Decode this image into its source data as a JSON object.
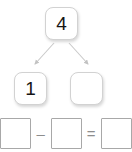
{
  "page": {
    "background_color": "#ffffff"
  },
  "number_bond": {
    "whole": {
      "label": "whole",
      "value": "4",
      "filled": true
    },
    "parts": [
      {
        "label": "part-left",
        "value": "1",
        "filled": true
      },
      {
        "label": "part-right",
        "value": "",
        "filled": false
      }
    ],
    "arrows": [
      {
        "name": "arrow-to-left-part",
        "direction": "down-left"
      },
      {
        "name": "arrow-to-right-part",
        "direction": "down-right"
      }
    ],
    "colors": {
      "box_border": "#d2d2d2",
      "arrow": "#c9c9c9",
      "digit": "#151515"
    }
  },
  "equation": {
    "minuend": "",
    "operator_minus": "–",
    "subtrahend": "",
    "operator_equals": "=",
    "difference": "",
    "colors": {
      "box_border": "#a8a8a8",
      "operator": "#8d8d8d"
    }
  }
}
